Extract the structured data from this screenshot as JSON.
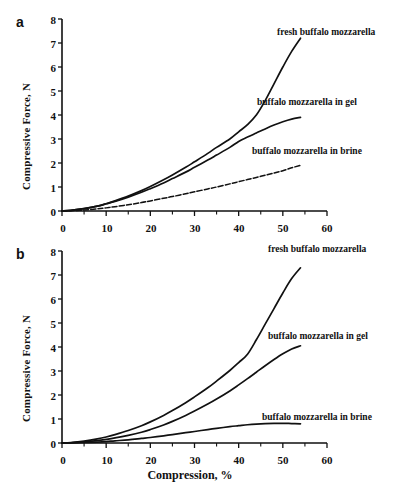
{
  "figure": {
    "panels": [
      {
        "letter": "a",
        "xlabel": "",
        "ylabel": "Compressive Force, N"
      },
      {
        "letter": "b",
        "xlabel": "Compression, %",
        "ylabel": "Compressive Force, N"
      }
    ]
  },
  "axis": {
    "x_ticks": [
      "0",
      "10",
      "20",
      "30",
      "40",
      "50",
      "60"
    ],
    "y_ticks": [
      "8",
      "7",
      "6",
      "5",
      "4",
      "3",
      "2",
      "1",
      "0"
    ]
  },
  "labels": {
    "fresh": "fresh buffalo mozzarella",
    "gel": "buffalo mozzarella in gel",
    "brine": "buffalo mozzarella in brine"
  },
  "colors": {
    "line": "#111111",
    "axis": "#111111",
    "background": "#ffffff"
  },
  "chart_data": [
    {
      "type": "line",
      "panel": "a",
      "title": "",
      "xlabel": "Compression, %",
      "ylabel": "Compressive Force, N",
      "xlim": [
        0,
        60
      ],
      "ylim": [
        0,
        8
      ],
      "xticks": [
        0,
        10,
        20,
        30,
        40,
        50,
        60
      ],
      "yticks": [
        0,
        1,
        2,
        3,
        4,
        5,
        6,
        7,
        8
      ],
      "grid": false,
      "legend": "inline-annotations",
      "series": [
        {
          "name": "fresh buffalo mozzarella",
          "style": "solid",
          "x": [
            0,
            2,
            5,
            8,
            10,
            12,
            15,
            18,
            20,
            23,
            25,
            28,
            30,
            33,
            35,
            38,
            40,
            42,
            44,
            46,
            48,
            50,
            52,
            54
          ],
          "y": [
            0.0,
            0.03,
            0.1,
            0.2,
            0.3,
            0.42,
            0.62,
            0.85,
            1.02,
            1.3,
            1.5,
            1.82,
            2.05,
            2.4,
            2.65,
            3.0,
            3.3,
            3.6,
            4.0,
            4.6,
            5.3,
            6.0,
            6.65,
            7.2
          ]
        },
        {
          "name": "buffalo mozzarella in gel",
          "style": "solid",
          "x": [
            0,
            2,
            5,
            8,
            10,
            12,
            15,
            18,
            20,
            23,
            25,
            28,
            30,
            33,
            35,
            38,
            40,
            42,
            44,
            46,
            48,
            50,
            52,
            54
          ],
          "y": [
            0.0,
            0.03,
            0.1,
            0.2,
            0.3,
            0.4,
            0.58,
            0.78,
            0.93,
            1.17,
            1.35,
            1.62,
            1.82,
            2.12,
            2.33,
            2.65,
            2.9,
            3.08,
            3.25,
            3.42,
            3.58,
            3.72,
            3.83,
            3.9
          ]
        },
        {
          "name": "buffalo mozzarella in brine",
          "style": "dashed",
          "x": [
            0,
            2,
            5,
            8,
            10,
            12,
            15,
            18,
            20,
            23,
            25,
            28,
            30,
            33,
            35,
            38,
            40,
            42,
            44,
            46,
            48,
            50,
            52,
            54
          ],
          "y": [
            0.0,
            0.01,
            0.04,
            0.09,
            0.13,
            0.18,
            0.26,
            0.35,
            0.42,
            0.53,
            0.6,
            0.72,
            0.8,
            0.92,
            1.0,
            1.13,
            1.22,
            1.31,
            1.4,
            1.49,
            1.58,
            1.68,
            1.8,
            1.9
          ]
        }
      ]
    },
    {
      "type": "line",
      "panel": "b",
      "title": "",
      "xlabel": "Compression, %",
      "ylabel": "Compressive Force, N",
      "xlim": [
        0,
        60
      ],
      "ylim": [
        0,
        8
      ],
      "xticks": [
        0,
        10,
        20,
        30,
        40,
        50,
        60
      ],
      "yticks": [
        0,
        1,
        2,
        3,
        4,
        5,
        6,
        7,
        8
      ],
      "grid": false,
      "legend": "inline-annotations",
      "series": [
        {
          "name": "fresh buffalo mozzarella",
          "style": "solid",
          "x": [
            0,
            2,
            5,
            8,
            10,
            12,
            15,
            18,
            20,
            23,
            25,
            28,
            30,
            33,
            35,
            38,
            40,
            42,
            44,
            46,
            48,
            50,
            52,
            54
          ],
          "y": [
            0.0,
            0.02,
            0.08,
            0.17,
            0.25,
            0.35,
            0.52,
            0.72,
            0.88,
            1.15,
            1.35,
            1.68,
            1.92,
            2.3,
            2.58,
            3.02,
            3.35,
            3.7,
            4.3,
            4.95,
            5.6,
            6.25,
            6.85,
            7.3
          ]
        },
        {
          "name": "buffalo mozzarella in gel",
          "style": "solid",
          "x": [
            0,
            2,
            5,
            8,
            10,
            12,
            15,
            18,
            20,
            23,
            25,
            28,
            30,
            33,
            35,
            38,
            40,
            42,
            44,
            46,
            48,
            50,
            52,
            54
          ],
          "y": [
            0.0,
            0.01,
            0.05,
            0.1,
            0.15,
            0.21,
            0.32,
            0.45,
            0.56,
            0.75,
            0.9,
            1.15,
            1.33,
            1.62,
            1.83,
            2.17,
            2.42,
            2.68,
            2.95,
            3.22,
            3.48,
            3.72,
            3.92,
            4.05
          ]
        },
        {
          "name": "buffalo mozzarella in brine",
          "style": "solid",
          "x": [
            0,
            2,
            5,
            8,
            10,
            12,
            15,
            18,
            20,
            23,
            25,
            28,
            30,
            33,
            35,
            38,
            40,
            42,
            44,
            46,
            48,
            50,
            52,
            54
          ],
          "y": [
            0.0,
            0.005,
            0.02,
            0.04,
            0.06,
            0.09,
            0.13,
            0.19,
            0.23,
            0.3,
            0.35,
            0.43,
            0.48,
            0.56,
            0.61,
            0.68,
            0.72,
            0.76,
            0.79,
            0.81,
            0.82,
            0.82,
            0.81,
            0.8
          ]
        }
      ]
    }
  ]
}
